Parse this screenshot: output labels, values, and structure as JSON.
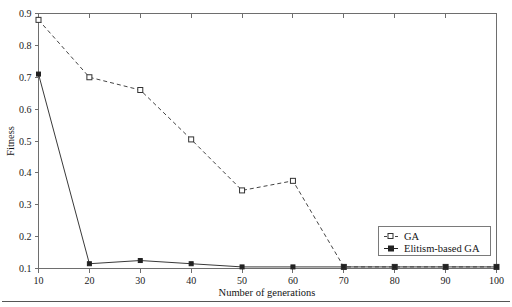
{
  "chart_data": {
    "type": "line",
    "title": "",
    "xlabel": "Number of generations",
    "ylabel": "Fitness",
    "x": [
      10,
      20,
      30,
      40,
      50,
      60,
      70,
      80,
      90,
      100
    ],
    "xtick_labels": [
      "10",
      "20",
      "30",
      "40",
      "50",
      "60",
      "70",
      "80",
      "90",
      "100"
    ],
    "ytick_labels": [
      "0.1",
      "0.2",
      "0.3",
      "0.4",
      "0.5",
      "0.6",
      "0.7",
      "0.8",
      "0.9"
    ],
    "yticks": [
      0.1,
      0.2,
      0.3,
      0.4,
      0.5,
      0.6,
      0.7,
      0.8,
      0.9
    ],
    "xlim": [
      10,
      100
    ],
    "ylim": [
      0.1,
      0.9
    ],
    "grid": false,
    "legend_position": "lower-right",
    "series": [
      {
        "name": "GA",
        "values": [
          0.88,
          0.7,
          0.66,
          0.505,
          0.345,
          0.375,
          0.105,
          0.105,
          0.105,
          0.105
        ],
        "line_style": "dashed",
        "marker": "open-square",
        "color": "#444444"
      },
      {
        "name": "Elitism-based GA",
        "values": [
          0.71,
          0.115,
          0.125,
          0.115,
          0.105,
          0.105,
          0.105,
          0.105,
          0.105,
          0.105
        ],
        "line_style": "solid",
        "marker": "filled-square",
        "color": "#222222"
      }
    ]
  },
  "legend": {
    "entries": [
      {
        "label": "GA"
      },
      {
        "label": "Elitism-based GA"
      }
    ]
  },
  "axes": {
    "x_title": "Number of generations",
    "y_title": "Fitness"
  }
}
